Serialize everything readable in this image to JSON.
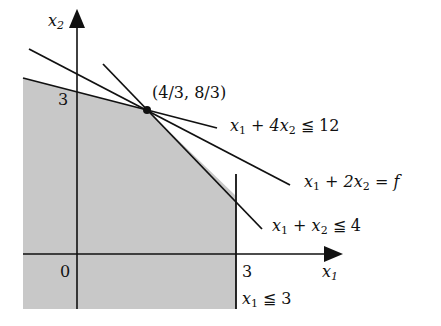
{
  "diagram": {
    "title": "",
    "axes": {
      "x_label": "x",
      "x_sub": "1",
      "y_label": "x",
      "y_sub": "2",
      "origin_label": "0",
      "x_tick_label": "3",
      "y_tick_label": "3"
    },
    "point": {
      "label": "(4/3, 8/3)"
    },
    "constraints": [
      {
        "id": "c1",
        "text_pre": "x",
        "sub1": "1",
        "mid": " + 4x",
        "sub2": "2",
        "post": " ≦ 12"
      },
      {
        "id": "objective",
        "text_pre": "x",
        "sub1": "1",
        "mid": " + 2x",
        "sub2": "2",
        "post": " = f"
      },
      {
        "id": "c2",
        "text_pre": "x",
        "sub1": "1",
        "mid": " + x",
        "sub2": "2",
        "post": " ≦ 4"
      },
      {
        "id": "c3",
        "text_pre": "x",
        "sub1": "1",
        "mid": "",
        "sub2": "",
        "post": " ≦ 3"
      }
    ],
    "colors": {
      "feasible_fill": "#c8c8c8",
      "line": "#111111",
      "background": "#ffffff"
    }
  }
}
